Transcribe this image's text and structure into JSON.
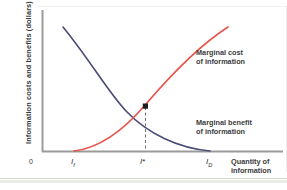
{
  "figure": {
    "background": "#ffffff",
    "accent_cost": "#e8534a",
    "accent_benefit": "#4a4a78",
    "axis_color": "#8c8c8c"
  },
  "axes": {
    "y_title": "Information costs and benefits (dollars)",
    "x_title_line1": "Quantity of",
    "x_title_line2": "information",
    "origin_label": "0"
  },
  "ticks": {
    "x": [
      {
        "id": "i-low",
        "base": "I",
        "sub": "f",
        "star": ""
      },
      {
        "id": "i-star",
        "base": "I",
        "sub": "",
        "star": "*"
      },
      {
        "id": "i-high",
        "base": "I",
        "sub": "D",
        "star": ""
      }
    ]
  },
  "annotations": {
    "marginal_cost_line1": "Marginal cost",
    "marginal_cost_line2": "of information",
    "marginal_benefit_line1": "Marginal benefit",
    "marginal_benefit_line2": "of information"
  },
  "chart_data": {
    "type": "line",
    "title": "",
    "xlabel": "Quantity of information",
    "ylabel": "Information costs and benefits (dollars)",
    "xlim": [
      0,
      1
    ],
    "ylim": [
      0,
      1
    ],
    "grid": false,
    "legend": "annotated-inline",
    "x_tick_labels": [
      "0",
      "I_f",
      "I*",
      "I_D"
    ],
    "x_tick_positions": [
      0.0,
      0.18,
      0.48,
      0.86
    ],
    "series": [
      {
        "name": "Marginal cost of information",
        "color": "#e8534a",
        "shape": "increasing-convex",
        "points": [
          {
            "x": 0.18,
            "y": 0.0
          },
          {
            "x": 0.28,
            "y": 0.07
          },
          {
            "x": 0.38,
            "y": 0.17
          },
          {
            "x": 0.48,
            "y": 0.33
          },
          {
            "x": 0.58,
            "y": 0.5
          },
          {
            "x": 0.7,
            "y": 0.7
          },
          {
            "x": 0.82,
            "y": 0.9
          },
          {
            "x": 0.88,
            "y": 1.0
          }
        ]
      },
      {
        "name": "Marginal benefit of information",
        "color": "#4a4a78",
        "shape": "decreasing-convex",
        "points": [
          {
            "x": 0.1,
            "y": 1.0
          },
          {
            "x": 0.2,
            "y": 0.86
          },
          {
            "x": 0.32,
            "y": 0.63
          },
          {
            "x": 0.48,
            "y": 0.33
          },
          {
            "x": 0.62,
            "y": 0.18
          },
          {
            "x": 0.76,
            "y": 0.07
          },
          {
            "x": 0.86,
            "y": 0.0
          }
        ]
      }
    ],
    "equilibrium": {
      "x": 0.48,
      "y": 0.33,
      "label": "I*",
      "marker": "square"
    },
    "dropline": {
      "from_y": 0.33,
      "to_y": 0.0,
      "style": "dashed"
    }
  }
}
